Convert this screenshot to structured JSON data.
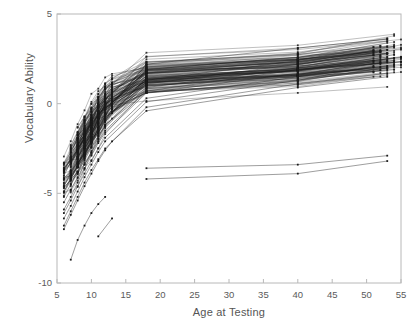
{
  "chart_data": {
    "type": "line",
    "title": "",
    "xlabel": "Age at Testing",
    "ylabel": "Vocabulary Ability",
    "xlim": [
      5,
      55
    ],
    "ylim": [
      -10,
      5
    ],
    "xticks": [
      5,
      10,
      15,
      20,
      25,
      30,
      35,
      40,
      45,
      50,
      55
    ],
    "xtick_labels": [
      "5",
      "10",
      "15",
      "20",
      "25",
      "30",
      "35",
      "40",
      "45",
      "50",
      "55"
    ],
    "yticks": [
      5,
      0,
      -5,
      -10
    ],
    "ytick_labels": [
      "5",
      "0",
      "-5",
      "-10"
    ],
    "grid": false,
    "legend": null,
    "marker": "filled-square",
    "line_color": "#1a1a1a",
    "measurement_ages": [
      6,
      7,
      8,
      9,
      10,
      11,
      12,
      13,
      18,
      40,
      53
    ],
    "n_subjects": 120,
    "series": [
      {
        "name": "s1",
        "x": [
          6,
          7,
          8,
          9,
          10,
          11,
          12,
          18,
          40,
          53
        ],
        "values": [
          -5.9,
          -5.2,
          -4.4,
          -3.6,
          -2.9,
          -2.2,
          -1.6,
          0.6,
          1.7,
          2.3
        ]
      },
      {
        "name": "s2",
        "x": [
          6,
          7,
          8,
          9,
          10,
          11,
          12,
          18,
          40,
          53
        ],
        "values": [
          -6.4,
          -5.7,
          -4.9,
          -4.1,
          -3.4,
          -2.7,
          -2.1,
          0.1,
          1.3,
          1.9
        ]
      },
      {
        "name": "s3",
        "x": [
          6,
          7,
          8,
          9,
          10,
          11,
          12,
          18,
          40,
          53
        ],
        "values": [
          -5.2,
          -4.5,
          -3.8,
          -3.0,
          -2.4,
          -1.8,
          -1.2,
          0.9,
          2.0,
          2.6
        ]
      },
      {
        "name": "s4",
        "x": [
          6,
          7,
          8,
          9,
          10,
          11,
          12,
          13,
          18,
          40,
          53
        ],
        "values": [
          -7.0,
          -6.2,
          -5.4,
          -4.6,
          -3.9,
          -3.2,
          -2.6,
          -2.1,
          -0.4,
          0.9,
          1.5
        ]
      },
      {
        "name": "s5",
        "x": [
          6,
          7,
          8,
          9,
          10,
          11,
          12,
          18,
          40,
          53
        ],
        "values": [
          -4.6,
          -3.9,
          -3.2,
          -2.5,
          -1.9,
          -1.3,
          -0.8,
          1.3,
          2.4,
          3.0
        ]
      },
      {
        "name": "s6-low-outlier",
        "x": [
          7,
          8,
          9,
          10,
          11,
          12
        ],
        "values": [
          -8.7,
          -7.6,
          -6.8,
          -6.1,
          -5.6,
          -5.2
        ]
      },
      {
        "name": "s7-isolated",
        "x": [
          11,
          13
        ],
        "values": [
          -7.4,
          -6.4
        ]
      },
      {
        "name": "s8-high",
        "x": [
          10,
          11,
          12,
          13,
          18,
          40,
          53
        ],
        "values": [
          -2.2,
          -1.4,
          -0.7,
          -0.1,
          2.2,
          3.1,
          3.6
        ]
      },
      {
        "name": "s9-high",
        "x": [
          12,
          13,
          18,
          40,
          53
        ],
        "values": [
          -1.0,
          -0.3,
          1.9,
          2.6,
          3.2
        ]
      },
      {
        "name": "s10-low-adult",
        "x": [
          18,
          40,
          53
        ],
        "values": [
          -3.6,
          -3.4,
          -2.9
        ]
      },
      {
        "name": "s11-low-adult",
        "x": [
          18,
          40,
          53
        ],
        "values": [
          -4.2,
          -3.9,
          -3.2
        ]
      },
      {
        "name": "s12",
        "x": [
          6,
          7,
          8,
          9,
          10,
          11,
          12,
          18,
          40,
          53
        ],
        "values": [
          -6.8,
          -6.0,
          -5.2,
          -4.4,
          -3.7,
          -3.1,
          -2.5,
          -0.2,
          1.1,
          1.7
        ]
      },
      {
        "name": "s13",
        "x": [
          6,
          7,
          8,
          9,
          10,
          11,
          12,
          18,
          40,
          53
        ],
        "values": [
          -5.5,
          -4.8,
          -4.1,
          -3.4,
          -2.7,
          -2.1,
          -1.5,
          0.7,
          1.9,
          2.4
        ]
      },
      {
        "name": "s14",
        "x": [
          6,
          7,
          8,
          9,
          10,
          11,
          12,
          18,
          40,
          53
        ],
        "values": [
          -6.1,
          -5.4,
          -4.6,
          -3.9,
          -3.2,
          -2.5,
          -1.9,
          0.3,
          1.5,
          2.1
        ]
      },
      {
        "name": "s15",
        "x": [
          6,
          7,
          8,
          9,
          10,
          11,
          12,
          18,
          40,
          53
        ],
        "values": [
          -4.9,
          -4.2,
          -3.5,
          -2.8,
          -2.2,
          -1.6,
          -1.0,
          1.1,
          2.2,
          2.8
        ]
      }
    ]
  },
  "axes": {
    "y_ticks": [
      {
        "label": "5",
        "value": 5
      },
      {
        "label": "0",
        "value": 0
      },
      {
        "label": "-5",
        "value": -5
      },
      {
        "label": "-10",
        "value": -10
      }
    ],
    "x_ticks": [
      {
        "label": "5",
        "value": 5
      },
      {
        "label": "10",
        "value": 10
      },
      {
        "label": "15",
        "value": 15
      },
      {
        "label": "20",
        "value": 20
      },
      {
        "label": "25",
        "value": 25
      },
      {
        "label": "30",
        "value": 30
      },
      {
        "label": "35",
        "value": 35
      },
      {
        "label": "40",
        "value": 40
      },
      {
        "label": "45",
        "value": 45
      },
      {
        "label": "50",
        "value": 50
      },
      {
        "label": "55",
        "value": 55
      }
    ],
    "x_axis_label": "Age at Testing",
    "y_axis_label": "Vocabulary Ability"
  },
  "colors": {
    "background": "#ffffff",
    "frame": "#b8b8b8",
    "data_line": "#1a1a1a",
    "tick_text": "#5a5a5a"
  }
}
